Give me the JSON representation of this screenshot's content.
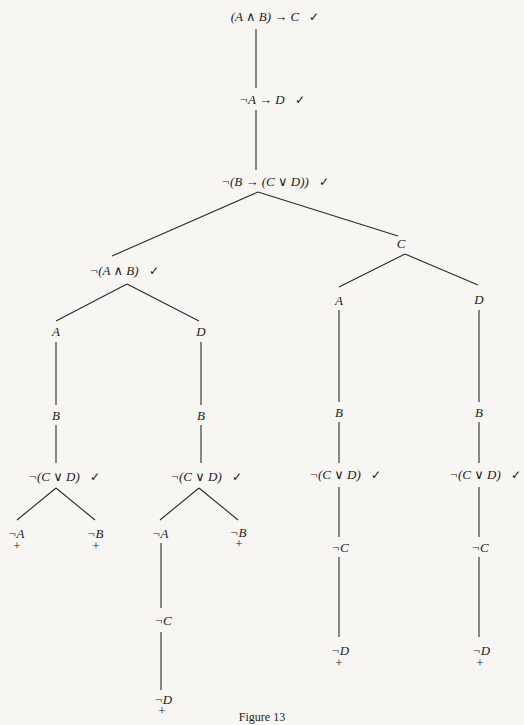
{
  "figure": {
    "caption": "Figure 13",
    "check_mark": "✓",
    "closed_mark": "+"
  },
  "nodes": {
    "root": "(A ∧ B) → C",
    "n2": "¬A → D",
    "n3": "¬(B → (C ∨ D))",
    "left_branch": "¬(A ∧ B)",
    "right_branch": "C",
    "ll_A": "A",
    "lr_D": "D",
    "rl_A": "A",
    "rr_D": "D",
    "ll_B": "B",
    "lr_B": "B",
    "rl_B": "B",
    "rr_B": "B",
    "ll_notCvD": "¬(C ∨ D)",
    "lr_notCvD": "¬(C ∨ D)",
    "rl_notCvD": "¬(C ∨ D)",
    "rr_notCvD": "¬(C ∨ D)",
    "ll_notA": "¬A",
    "ll_notB": "¬B",
    "lr_notA": "¬A",
    "lr_notB": "¬B",
    "lr_notC": "¬C",
    "lr_notD": "¬D",
    "rl_notC": "¬C",
    "rl_notD": "¬D",
    "rr_notC": "¬C",
    "rr_notD": "¬D"
  }
}
